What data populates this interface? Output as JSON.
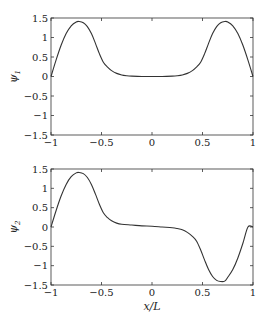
{
  "chart_data": [
    {
      "type": "line",
      "title": "",
      "xlabel": "",
      "ylabel": "ψ1",
      "ylabel_main": "ψ",
      "ylabel_sub": "1",
      "xlim": [
        -1,
        1
      ],
      "ylim": [
        -1.5,
        1.5
      ],
      "grid": false,
      "legend": null,
      "xticks": [
        -1,
        -0.5,
        0,
        0.5,
        1
      ],
      "xtick_labels": [
        "−1",
        "−0.5",
        "0",
        "0.5",
        "1"
      ],
      "yticks": [
        1.5,
        1,
        0.5,
        0,
        -0.5,
        -1,
        -1.5
      ],
      "ytick_labels": [
        "1.5",
        "1",
        "0.5",
        "0",
        "−0.5",
        "−1",
        "−1.5"
      ],
      "series": [
        {
          "name": "psi1",
          "color": "#333333",
          "x": [
            -1.0,
            -0.95,
            -0.9,
            -0.85,
            -0.8,
            -0.75,
            -0.72,
            -0.68,
            -0.64,
            -0.6,
            -0.56,
            -0.52,
            -0.48,
            -0.44,
            -0.4,
            -0.35,
            -0.3,
            -0.25,
            -0.2,
            -0.1,
            0.0,
            0.1,
            0.2,
            0.25,
            0.3,
            0.35,
            0.4,
            0.44,
            0.48,
            0.52,
            0.56,
            0.6,
            0.64,
            0.68,
            0.72,
            0.75,
            0.8,
            0.85,
            0.9,
            0.95,
            1.0
          ],
          "y": [
            0.0,
            0.42,
            0.8,
            1.1,
            1.3,
            1.4,
            1.41,
            1.38,
            1.28,
            1.1,
            0.85,
            0.58,
            0.36,
            0.24,
            0.15,
            0.08,
            0.04,
            0.02,
            0.01,
            0.0,
            0.0,
            0.0,
            0.01,
            0.02,
            0.04,
            0.08,
            0.15,
            0.24,
            0.36,
            0.58,
            0.85,
            1.1,
            1.28,
            1.38,
            1.41,
            1.4,
            1.3,
            1.1,
            0.8,
            0.42,
            0.0
          ]
        }
      ]
    },
    {
      "type": "line",
      "title": "",
      "xlabel": "x/L",
      "ylabel": "ψ2",
      "ylabel_main": "ψ",
      "ylabel_sub": "2",
      "xlim": [
        -1,
        1
      ],
      "ylim": [
        -1.5,
        1.5
      ],
      "grid": false,
      "legend": null,
      "xticks": [
        -1,
        -0.5,
        0,
        0.5,
        1
      ],
      "xtick_labels": [
        "−1",
        "−0.5",
        "0",
        "0.5",
        "1"
      ],
      "yticks": [
        1.5,
        1,
        0.5,
        0,
        -0.5,
        -1,
        -1.5
      ],
      "ytick_labels": [
        "1.5",
        "1",
        "0.5",
        "0",
        "−0.5",
        "−1",
        "−1.5"
      ],
      "series": [
        {
          "name": "psi2",
          "color": "#333333",
          "x": [
            -1.0,
            -0.95,
            -0.9,
            -0.85,
            -0.8,
            -0.75,
            -0.72,
            -0.68,
            -0.64,
            -0.6,
            -0.56,
            -0.52,
            -0.48,
            -0.44,
            -0.4,
            -0.35,
            -0.3,
            -0.2,
            -0.1,
            0.0,
            0.1,
            0.2,
            0.25,
            0.3,
            0.35,
            0.4,
            0.44,
            0.48,
            0.52,
            0.56,
            0.6,
            0.64,
            0.68,
            0.72,
            0.75,
            0.8,
            0.85,
            0.9,
            0.95,
            1.0
          ],
          "y": [
            0.0,
            0.42,
            0.8,
            1.1,
            1.3,
            1.4,
            1.41,
            1.38,
            1.28,
            1.1,
            0.85,
            0.58,
            0.36,
            0.24,
            0.16,
            0.1,
            0.07,
            0.05,
            0.03,
            0.02,
            0.0,
            -0.02,
            -0.04,
            -0.07,
            -0.14,
            -0.24,
            -0.36,
            -0.58,
            -0.85,
            -1.1,
            -1.28,
            -1.38,
            -1.41,
            -1.4,
            -1.3,
            -1.1,
            -0.8,
            -0.42,
            0.0,
            0.0
          ]
        }
      ]
    }
  ]
}
